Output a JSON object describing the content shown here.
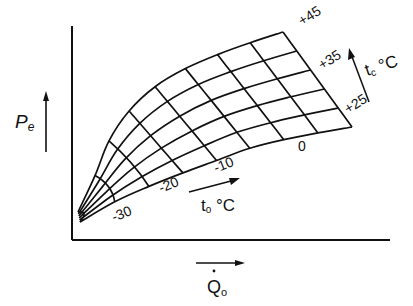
{
  "diagram": {
    "type": "performance-grid",
    "y_axis_label": {
      "main": "P",
      "sub": "e"
    },
    "x_axis_label": {
      "main": "Q",
      "sub": "o",
      "dot": "·"
    },
    "tc_label": {
      "main": "t",
      "sub": "c",
      "unit": " °C"
    },
    "to_label": {
      "main": "t",
      "sub": "o",
      "unit": " °C"
    },
    "tc_curves": [
      "+45",
      "+40",
      "+35",
      "+30",
      "+25",
      "+20"
    ],
    "tc_labels_shown": [
      {
        "text": "+45",
        "x": 302,
        "y": 26,
        "rot": -32
      },
      {
        "text": "+35",
        "x": 322,
        "y": 70,
        "rot": -32
      },
      {
        "text": "+25",
        "x": 348,
        "y": 114,
        "rot": -32
      }
    ],
    "to_labels_shown": [
      {
        "text": "-30",
        "x": 114,
        "y": 222,
        "rot": -22
      },
      {
        "text": "-20",
        "x": 161,
        "y": 193,
        "rot": -22
      },
      {
        "text": "-10",
        "x": 216,
        "y": 173,
        "rot": -22
      },
      {
        "text": "0",
        "x": 298,
        "y": 151,
        "rot": 0
      }
    ],
    "grid": {
      "top_curve": [
        [
          78,
          212
        ],
        [
          100,
          165
        ],
        [
          113,
          130
        ],
        [
          140,
          98
        ],
        [
          168,
          77
        ],
        [
          203,
          60
        ],
        [
          243,
          45
        ],
        [
          283,
          32
        ]
      ],
      "bottom_curve": [
        [
          80,
          222
        ],
        [
          96,
          212
        ],
        [
          118,
          200
        ],
        [
          145,
          188
        ],
        [
          185,
          172
        ],
        [
          226,
          157
        ],
        [
          256,
          146
        ],
        [
          300,
          136
        ],
        [
          352,
          127
        ]
      ],
      "note_rows": 6
    },
    "colors": {
      "line": "#111111",
      "background": "#ffffff"
    }
  }
}
